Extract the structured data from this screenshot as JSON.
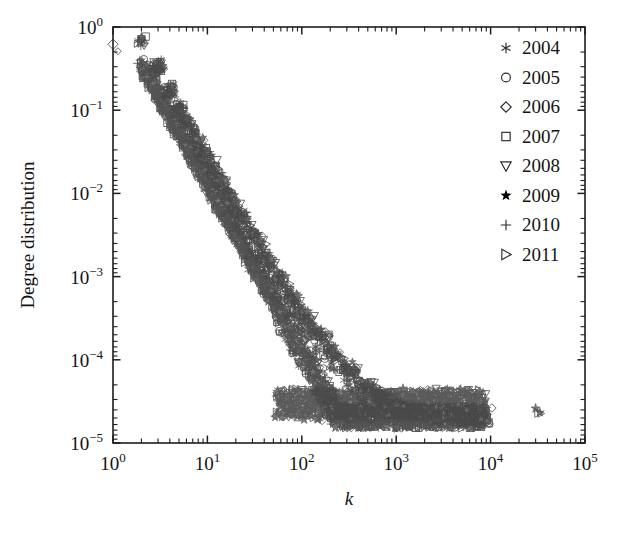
{
  "figure": {
    "background_color": "#ffffff",
    "frame_color": "#1d1d1d"
  },
  "chart_data": {
    "type": "scatter",
    "title": "",
    "subtitle": "",
    "xlabel": "k",
    "ylabel": "Degree distribution",
    "xscale": "log",
    "yscale": "log",
    "xlim": [
      1,
      100000
    ],
    "ylim": [
      1e-05,
      1
    ],
    "grid": false,
    "legend_position": "top-right",
    "xtick_labels": [
      "10^0",
      "10^1",
      "10^2",
      "10^3",
      "10^4",
      "10^5"
    ],
    "xtick_values": [
      1,
      10,
      100,
      1000,
      10000,
      100000
    ],
    "ytick_labels": [
      "10^0",
      "10^-1",
      "10^-2",
      "10^-3",
      "10^-4",
      "10^-5"
    ],
    "ytick_values": [
      1,
      0.1,
      0.01,
      0.001,
      0.0001,
      1e-05
    ],
    "annotations": [
      "Isolated outlier markers (2009 star and 2011 right-triangle) near k = 3x10^4, P(k) = 2.5x10^-5"
    ],
    "series": [
      {
        "name": "2004",
        "marker": "asterisk",
        "color": "#3a3a3a",
        "x": [
          1,
          2,
          3,
          4,
          5,
          6,
          8,
          10,
          13,
          17,
          22,
          30,
          40,
          55,
          75,
          100,
          140,
          200,
          300,
          450,
          700,
          1100,
          1800,
          2800,
          4500,
          6500
        ],
        "y": [
          0.62,
          0.74,
          0.35,
          0.18,
          0.105,
          0.068,
          0.036,
          0.021,
          0.0115,
          0.0062,
          0.0036,
          0.0019,
          0.0011,
          0.00062,
          0.00036,
          0.00022,
          0.00013,
          8e-05,
          5e-05,
          3.5e-05,
          2.7e-05,
          2.4e-05,
          2.2e-05,
          2.1e-05,
          2e-05,
          2e-05
        ]
      },
      {
        "name": "2005",
        "marker": "circle",
        "color": "#3a3a3a",
        "x": [
          1,
          2,
          3,
          4,
          5,
          7,
          9,
          12,
          16,
          21,
          28,
          38,
          52,
          70,
          95,
          130,
          185,
          270,
          400,
          600,
          950,
          1500,
          2400,
          3800,
          6000,
          8000
        ],
        "y": [
          0.6,
          0.72,
          0.33,
          0.17,
          0.1,
          0.052,
          0.03,
          0.017,
          0.0095,
          0.0053,
          0.0031,
          0.0017,
          0.00095,
          0.00055,
          0.00033,
          0.0002,
          0.00012,
          7.5e-05,
          5e-05,
          3.4e-05,
          2.7e-05,
          2.3e-05,
          2.2e-05,
          2e-05,
          2e-05,
          2e-05
        ]
      },
      {
        "name": "2006",
        "marker": "diamond",
        "color": "#3a3a3a",
        "x": [
          1,
          2,
          3,
          4,
          6,
          8,
          11,
          14,
          19,
          25,
          34,
          46,
          62,
          85,
          115,
          160,
          230,
          330,
          500,
          780,
          1200,
          1900,
          3000,
          4800,
          7000
        ],
        "y": [
          0.6,
          0.7,
          0.32,
          0.165,
          0.075,
          0.04,
          0.023,
          0.0135,
          0.0078,
          0.0045,
          0.0026,
          0.0015,
          0.00085,
          0.0005,
          0.0003,
          0.00019,
          0.00012,
          7e-05,
          4.6e-05,
          3.2e-05,
          2.6e-05,
          2.3e-05,
          2.1e-05,
          2e-05,
          2e-05
        ]
      },
      {
        "name": "2007",
        "marker": "square",
        "color": "#3a3a3a",
        "x": [
          2,
          3,
          4,
          5,
          7,
          9,
          12,
          16,
          22,
          29,
          40,
          54,
          72,
          98,
          135,
          190,
          280,
          420,
          650,
          1000,
          1600,
          2500,
          4000,
          6200,
          8500
        ],
        "y": [
          0.71,
          0.34,
          0.175,
          0.105,
          0.055,
          0.031,
          0.018,
          0.0098,
          0.0054,
          0.0032,
          0.0018,
          0.001,
          0.00058,
          0.00034,
          0.00021,
          0.00013,
          8e-05,
          5e-05,
          3.4e-05,
          2.7e-05,
          2.3e-05,
          2.1e-05,
          2e-05,
          2e-05,
          2e-05
        ]
      },
      {
        "name": "2008",
        "marker": "triangle-down",
        "color": "#3a3a3a",
        "x": [
          2,
          3,
          5,
          6,
          8,
          11,
          15,
          20,
          27,
          36,
          48,
          65,
          88,
          120,
          170,
          240,
          350,
          530,
          820,
          1300,
          2000,
          3200,
          5000,
          7500
        ],
        "y": [
          0.69,
          0.33,
          0.1,
          0.07,
          0.038,
          0.022,
          0.0125,
          0.0072,
          0.0042,
          0.0024,
          0.0014,
          0.0008,
          0.00047,
          0.00029,
          0.00018,
          0.00011,
          7e-05,
          4.6e-05,
          3.1e-05,
          2.5e-05,
          2.2e-05,
          2.1e-05,
          2e-05,
          2e-05
        ]
      },
      {
        "name": "2009",
        "marker": "star",
        "color": "#2e2e2e",
        "x": [
          2,
          3,
          4,
          6,
          8,
          10,
          14,
          18,
          24,
          32,
          44,
          60,
          80,
          110,
          150,
          210,
          310,
          470,
          720,
          1150,
          1800,
          2900,
          4600,
          7200,
          30000
        ],
        "y": [
          0.76,
          0.36,
          0.185,
          0.08,
          0.042,
          0.026,
          0.0145,
          0.0085,
          0.0049,
          0.0029,
          0.0017,
          0.00095,
          0.00056,
          0.00034,
          0.00021,
          0.00013,
          8e-05,
          5e-05,
          3.5e-05,
          2.8e-05,
          2.4e-05,
          2.2e-05,
          2e-05,
          2e-05,
          2.6e-05
        ]
      },
      {
        "name": "2010",
        "marker": "plus",
        "color": "#3a3a3a",
        "x": [
          2,
          3,
          4,
          5,
          7,
          10,
          13,
          17,
          23,
          31,
          42,
          57,
          78,
          105,
          145,
          205,
          300,
          460,
          700,
          1100,
          1750,
          2700,
          4300,
          6800
        ],
        "y": [
          0.67,
          0.32,
          0.165,
          0.098,
          0.052,
          0.027,
          0.0155,
          0.0089,
          0.0051,
          0.003,
          0.0017,
          0.00098,
          0.00057,
          0.00035,
          0.00022,
          0.00013,
          8e-05,
          5e-05,
          3.4e-05,
          2.7e-05,
          2.3e-05,
          2.1e-05,
          2e-05,
          2e-05
        ]
      },
      {
        "name": "2011",
        "marker": "triangle-right",
        "color": "#3a3a3a",
        "x": [
          2,
          3,
          4,
          6,
          9,
          12,
          16,
          21,
          28,
          38,
          50,
          68,
          92,
          125,
          175,
          250,
          370,
          560,
          880,
          1400,
          2200,
          3500,
          5500,
          8200,
          32000
        ],
        "y": [
          0.64,
          0.3,
          0.155,
          0.076,
          0.034,
          0.019,
          0.011,
          0.0063,
          0.0037,
          0.0021,
          0.0013,
          0.00074,
          0.00044,
          0.00027,
          0.00017,
          0.00011,
          7e-05,
          4.4e-05,
          3e-05,
          2.5e-05,
          2.2e-05,
          2.1e-05,
          2e-05,
          2e-05,
          2.3e-05
        ]
      }
    ]
  },
  "legend": {
    "entries": [
      {
        "label": "2004",
        "marker": "asterisk"
      },
      {
        "label": "2005",
        "marker": "circle"
      },
      {
        "label": "2006",
        "marker": "diamond"
      },
      {
        "label": "2007",
        "marker": "square"
      },
      {
        "label": "2008",
        "marker": "triangle-down"
      },
      {
        "label": "2009",
        "marker": "star"
      },
      {
        "label": "2010",
        "marker": "plus"
      },
      {
        "label": "2011",
        "marker": "triangle-right"
      }
    ]
  }
}
